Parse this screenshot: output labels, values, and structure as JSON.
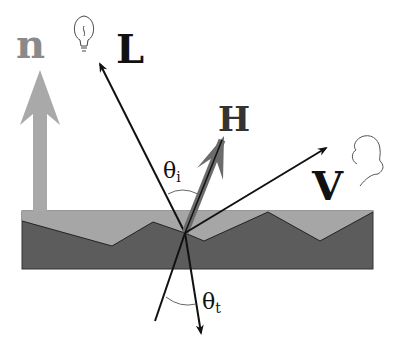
{
  "diagram": {
    "labels": {
      "normal": "n",
      "light": "L",
      "half": "H",
      "view": "V",
      "theta_i_symbol": "θ",
      "theta_i_sub": "i",
      "theta_t_symbol": "θ",
      "theta_t_sub": "t"
    },
    "icons": [
      "lightbulb-icon",
      "viewer-head-icon"
    ],
    "colors": {
      "surface_light": "#a6a6a6",
      "surface_dark": "#5c5c5c",
      "normal_arrow": "#a9a9a9",
      "normal_label": "#8a8a8a",
      "half_vector": "#6b6b6b",
      "lines": "#111111"
    }
  }
}
